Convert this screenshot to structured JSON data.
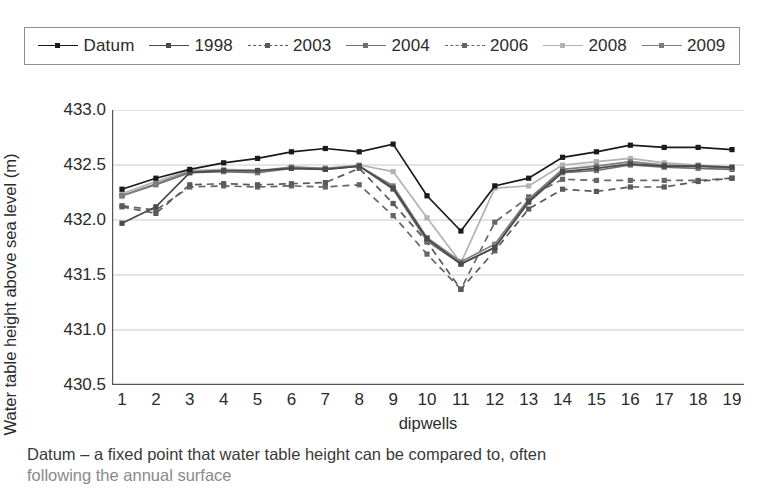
{
  "chart_data": {
    "type": "line",
    "title": "",
    "xlabel": "dipwells",
    "ylabel": "Water table height above sea level (m)",
    "x": [
      1,
      2,
      3,
      4,
      5,
      6,
      7,
      8,
      9,
      10,
      11,
      12,
      13,
      14,
      15,
      16,
      17,
      18,
      19
    ],
    "xtick_labels": [
      "1",
      "2",
      "3",
      "4",
      "5",
      "6",
      "7",
      "8",
      "9",
      "10",
      "11",
      "12",
      "13",
      "14",
      "15",
      "16",
      "17",
      "18",
      "19"
    ],
    "ytick_labels": [
      "430.5",
      "431.0",
      "431.5",
      "432.0",
      "432.5",
      "433.0"
    ],
    "ylim": [
      430.5,
      433.0
    ],
    "ytick_values": [
      430.5,
      431.0,
      431.5,
      432.0,
      432.5,
      433.0
    ],
    "grid": "horizontal",
    "legend_position": "top",
    "series": [
      {
        "name": "Datum",
        "color": "#1a1a1a",
        "dash": "solid",
        "marker": "square",
        "values": [
          432.28,
          432.38,
          432.46,
          432.52,
          432.56,
          432.62,
          432.65,
          432.62,
          432.69,
          432.22,
          431.9,
          432.31,
          432.38,
          432.57,
          432.62,
          432.68,
          432.66,
          432.66,
          432.64
        ]
      },
      {
        "name": "1998",
        "color": "#4a4a4a",
        "dash": "solid",
        "marker": "square",
        "values": [
          431.97,
          432.12,
          432.43,
          432.45,
          432.45,
          432.47,
          432.46,
          432.49,
          432.29,
          431.83,
          431.6,
          431.75,
          432.17,
          432.44,
          432.47,
          432.51,
          432.49,
          432.49,
          432.48
        ]
      },
      {
        "name": "2003",
        "color": "#5a5a5a",
        "dash": "dashed",
        "marker": "square",
        "values": [
          432.12,
          432.06,
          432.32,
          432.33,
          432.32,
          432.33,
          432.34,
          432.47,
          432.15,
          431.8,
          431.37,
          431.72,
          432.1,
          432.28,
          432.26,
          432.3,
          432.3,
          432.35,
          432.38
        ]
      },
      {
        "name": "2004",
        "color": "#6f6f6f",
        "dash": "solid",
        "marker": "square",
        "values": [
          432.22,
          432.32,
          432.43,
          432.44,
          432.43,
          432.47,
          432.46,
          432.49,
          432.28,
          431.81,
          431.6,
          431.75,
          432.16,
          432.43,
          432.45,
          432.5,
          432.48,
          432.47,
          432.46
        ]
      },
      {
        "name": "2006",
        "color": "#666666",
        "dash": "dashed",
        "marker": "square",
        "values": [
          432.13,
          432.09,
          432.3,
          432.31,
          432.3,
          432.31,
          432.3,
          432.32,
          432.04,
          431.69,
          431.37,
          431.98,
          432.21,
          432.37,
          432.36,
          432.36,
          432.36,
          432.36,
          432.38
        ]
      },
      {
        "name": "2008",
        "color": "#b2b2b2",
        "dash": "solid",
        "marker": "square",
        "values": [
          432.24,
          432.35,
          432.45,
          432.46,
          432.45,
          432.48,
          432.47,
          432.5,
          432.44,
          432.02,
          431.61,
          432.29,
          432.31,
          432.5,
          432.53,
          432.56,
          432.52,
          432.5,
          432.48
        ]
      },
      {
        "name": "2009",
        "color": "#7d7d7d",
        "dash": "solid",
        "marker": "square",
        "values": [
          432.22,
          432.33,
          432.44,
          432.45,
          432.44,
          432.48,
          432.47,
          432.49,
          432.31,
          431.84,
          431.62,
          431.78,
          432.19,
          432.46,
          432.49,
          432.53,
          432.5,
          432.49,
          432.47
        ]
      }
    ]
  },
  "caption": {
    "line1": "Datum – a fixed point that water table height can be compared to, often",
    "line2": "following the annual surface"
  }
}
